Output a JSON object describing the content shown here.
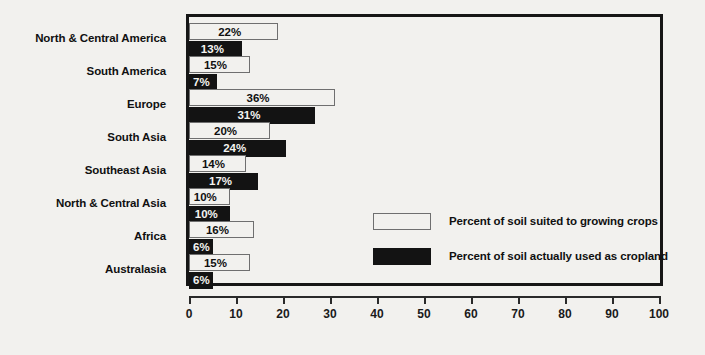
{
  "chart_data": {
    "type": "bar",
    "orientation": "horizontal",
    "title": "",
    "xlabel": "",
    "ylabel": "",
    "xlim": [
      0,
      100
    ],
    "xticks": [
      0,
      10,
      20,
      30,
      40,
      50,
      60,
      70,
      80,
      90,
      100
    ],
    "xtick_labels": [
      "0",
      "10",
      "20",
      "30",
      "40",
      "50",
      "60",
      "70",
      "80",
      "90",
      "100"
    ],
    "grid": false,
    "legend_position": "inside-lower-right",
    "categories": [
      "North & Central America",
      "South America",
      "Europe",
      "South Asia",
      "Southeast Asia",
      "North & Central Asia",
      "Africa",
      "Australasia"
    ],
    "series": [
      {
        "name": "Percent of soil suited to growing crops",
        "key": "suited",
        "color": "#f2f1ee",
        "border_color": "#6f6f6f",
        "values": [
          22,
          15,
          36,
          20,
          14,
          10,
          16,
          15
        ],
        "labels": [
          "22%",
          "15%",
          "36%",
          "20%",
          "14%",
          "10%",
          "16%",
          "15%"
        ]
      },
      {
        "name": "Percent of soil actually used as cropland",
        "key": "cropland",
        "color": "#131313",
        "border_color": "#131313",
        "values": [
          13,
          7,
          31,
          24,
          17,
          10,
          6,
          6
        ],
        "labels": [
          "13%",
          "7%",
          "31%",
          "24%",
          "17%",
          "10%",
          "6%",
          "6%"
        ]
      }
    ]
  },
  "legend": {
    "items": [
      {
        "label": "Percent of soil suited to growing crops",
        "swatch": "suited"
      },
      {
        "label": "Percent of soil actually used as cropland",
        "swatch": "cropland"
      }
    ]
  },
  "colors": {
    "background": "#f2f1ee",
    "frame": "#161616",
    "bar_light": "#f2f1ee",
    "bar_light_border": "#6f6f6f",
    "bar_dark": "#131313",
    "text": "#101010",
    "text_on_dark": "#f4f3f0",
    "axis": "#2a2a2a"
  }
}
